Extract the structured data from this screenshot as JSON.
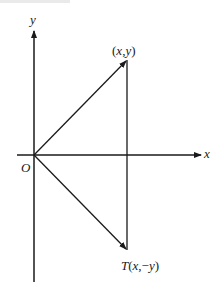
{
  "diagram": {
    "type": "coordinate-plane-reflection",
    "stroke_color": "#1a1a1a",
    "axes": {
      "x_label": "x",
      "y_label": "y",
      "origin_label": "O"
    },
    "points": {
      "original": {
        "label": "(x,y)"
      },
      "image": {
        "label": "T(x,−y)"
      }
    },
    "geometry": {
      "origin": [
        34,
        155
      ],
      "original_point": [
        127,
        60
      ],
      "image_point": [
        127,
        250
      ],
      "x_axis": {
        "from": [
          17,
          155
        ],
        "to": [
          202,
          155
        ]
      },
      "y_axis": {
        "from": [
          34,
          282
        ],
        "to": [
          34,
          30
        ]
      }
    }
  }
}
